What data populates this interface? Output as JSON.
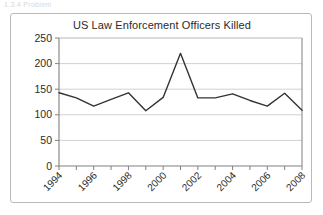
{
  "page": {
    "top_fragment": "1.3.4  Problem",
    "border_color": "#b9b9bd",
    "background": "#ffffff"
  },
  "chart_data": {
    "type": "line",
    "title": "US Law Enforcement Officers Killed",
    "xlabel": "",
    "ylabel": "",
    "categories": [
      "1994",
      "1995",
      "1996",
      "1997",
      "1998",
      "1999",
      "2000",
      "2001",
      "2002",
      "2003",
      "2004",
      "2005",
      "2006",
      "2007",
      "2008"
    ],
    "x_tick_labels": [
      "1994",
      "1996",
      "1998",
      "2000",
      "2002",
      "2004",
      "2006",
      "2008"
    ],
    "values": [
      143,
      133,
      117,
      130,
      143,
      108,
      134,
      220,
      133,
      133,
      141,
      128,
      117,
      142,
      109
    ],
    "ylim": [
      0,
      250
    ],
    "y_tick_labels": [
      "0",
      "50",
      "100",
      "150",
      "200",
      "250"
    ],
    "y_ticks": [
      0,
      50,
      100,
      150,
      200,
      250
    ],
    "grid": true,
    "legend": "none",
    "series": [
      {
        "name": "US Law Enforcement Officers Killed",
        "color": "#333333",
        "values": [
          143,
          133,
          117,
          130,
          143,
          108,
          134,
          220,
          133,
          133,
          141,
          128,
          117,
          142,
          109
        ]
      }
    ],
    "grid_color": "#cccccc",
    "axis_color": "#808080",
    "line_color": "#333333",
    "line_width": 1.4
  }
}
